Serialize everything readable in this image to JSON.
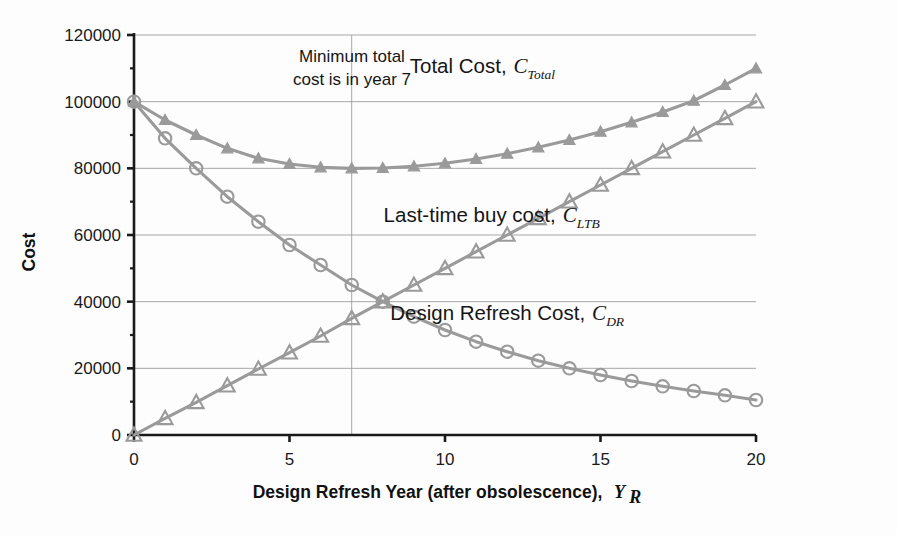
{
  "chart_data": {
    "type": "line",
    "title": "",
    "xlabel": "Design Refresh Year (after obsolescence), Y_R",
    "xlabel_text": "Design Refresh Year (after obsolescence),",
    "xlabel_symbol": "Y",
    "xlabel_symbol_sub": "R",
    "ylabel": "Cost",
    "xlim": [
      0,
      20
    ],
    "ylim": [
      0,
      120000
    ],
    "xticks": [
      0,
      5,
      10,
      15,
      20
    ],
    "xtick_labels": [
      "0",
      "5",
      "10",
      "15",
      "20"
    ],
    "yticks": [
      0,
      20000,
      40000,
      60000,
      80000,
      100000,
      120000
    ],
    "ytick_labels": [
      "0",
      "20000",
      "40000",
      "60000",
      "80000",
      "100000",
      "120000"
    ],
    "grid": "horizontal",
    "legend_position": "inline-annotations",
    "x": [
      0,
      1,
      2,
      3,
      4,
      5,
      6,
      7,
      8,
      9,
      10,
      11,
      12,
      13,
      14,
      15,
      16,
      17,
      18,
      19,
      20
    ],
    "series": [
      {
        "name": "Total Cost",
        "symbol": "C",
        "subscript": "Total",
        "marker": "triangle-filled",
        "color": "#9a9a9a",
        "values": [
          100000,
          94500,
          90000,
          86000,
          83000,
          81300,
          80300,
          80000,
          80100,
          80600,
          81500,
          82800,
          84400,
          86300,
          88500,
          91000,
          93800,
          96900,
          100300,
          105000,
          110000
        ],
        "label_x": 11.2,
        "label_y": 108500
      },
      {
        "name": "Last-time buy cost",
        "symbol": "C",
        "subscript": "LTB",
        "marker": "triangle-open",
        "color": "#9a9a9a",
        "values": [
          0,
          5000,
          9800,
          14800,
          19800,
          24700,
          29700,
          35000,
          40000,
          45000,
          50000,
          55000,
          60000,
          65000,
          70000,
          75000,
          80000,
          85000,
          90000,
          95000,
          100000
        ],
        "label_x": 11.5,
        "label_y": 64000
      },
      {
        "name": "Design Refresh Cost",
        "symbol": "C",
        "subscript": "DR",
        "marker": "circle-open",
        "color": "#9a9a9a",
        "values": [
          100000,
          89000,
          80000,
          71500,
          64000,
          57000,
          51000,
          45000,
          40000,
          35500,
          31500,
          28000,
          25000,
          22300,
          20000,
          18000,
          16200,
          14600,
          13200,
          11900,
          10500
        ],
        "label_x": 12.0,
        "label_y": 34500
      }
    ],
    "annotations": [
      {
        "name": "minimum-cost-note",
        "line1": "Minimum total",
        "line2": "cost is in year 7",
        "x": 7,
        "marker_line": true
      }
    ],
    "marker_line_x": 7,
    "marker_line_top": 120000,
    "marker_line_bottom": 0
  },
  "colors": {
    "series": "#9a9a9a",
    "axis": "#1a1a1a",
    "grid": "#9d9d9d",
    "text": "#151515",
    "background": "#fdfdfd"
  }
}
